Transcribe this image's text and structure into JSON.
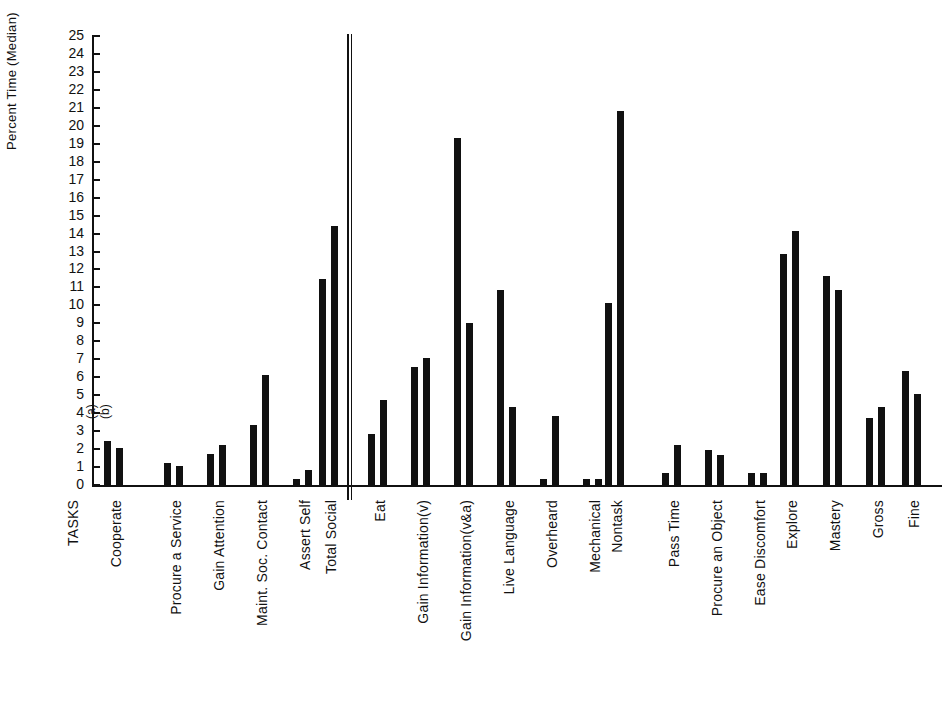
{
  "chart_data": {
    "type": "bar",
    "title": "",
    "xlabel": "TASKS",
    "ylabel": "Percent Time (Median)",
    "ylim": [
      0,
      25
    ],
    "yticks": [
      0,
      1,
      2,
      3,
      4,
      5,
      6,
      7,
      8,
      9,
      10,
      11,
      12,
      13,
      14,
      15,
      16,
      17,
      18,
      19,
      20,
      21,
      22,
      23,
      24,
      25
    ],
    "grid": false,
    "legend": "none",
    "annotations": [
      "(a)",
      "(b)"
    ],
    "series": [
      {
        "name": "(a)",
        "values": [
          2.5,
          1.3,
          1.8,
          3.4,
          0.4,
          11.5,
          2.9,
          6.6,
          19.4,
          10.9,
          0.4,
          0.4,
          10.2,
          0.7,
          2.0,
          0.7,
          12.9,
          11.7,
          3.8,
          6.4
        ]
      },
      {
        "name": "(b)",
        "values": [
          2.1,
          1.1,
          2.3,
          6.2,
          0.9,
          14.5,
          4.8,
          7.1,
          9.1,
          4.4,
          3.9,
          0.4,
          20.9,
          2.3,
          1.7,
          0.7,
          14.2,
          10.9,
          4.4,
          5.1
        ]
      }
    ],
    "categories": [
      "Cooperate",
      "Procure a Service",
      "Gain Attention",
      "Maint. Soc. Contact",
      "Assert Self",
      "Total Social",
      "Eat",
      "Gain Information(v)",
      "Gain Information(v&a)",
      "Live Language",
      "Overheard",
      "Mechanical",
      "Nontask",
      "Pass Time",
      "Procure an Object",
      "Ease Discomfort",
      "Explore",
      "Mastery",
      "Gross",
      "Fine"
    ],
    "group_divider_after_category": "Total Social"
  },
  "axis": {
    "y_title": "Percent Time (Median)",
    "x_title": "TASKS"
  },
  "colors": {
    "bar": "#111111",
    "axis": "#111111",
    "background": "#ffffff"
  }
}
